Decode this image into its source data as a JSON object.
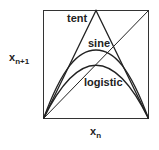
{
  "diagram": {
    "curves": [
      {
        "name": "tent",
        "label": "tent"
      },
      {
        "name": "sine",
        "label": "sine"
      },
      {
        "name": "logistic",
        "label": "logistic"
      }
    ],
    "ylabel": {
      "main": "x",
      "sub": "n+1"
    },
    "xlabel": {
      "main": "x",
      "sub": "n"
    },
    "line_color": "#222222"
  }
}
